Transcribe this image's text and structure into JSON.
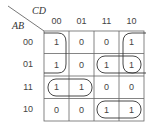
{
  "kmap": {
    "col_var": "CD",
    "row_var": "AB",
    "col_labels": [
      "00",
      "01",
      "11",
      "10"
    ],
    "row_labels": [
      "00",
      "01",
      "11",
      "10"
    ],
    "rows": [
      [
        "1",
        "0",
        "0",
        "1"
      ],
      [
        "1",
        "0",
        "1",
        "1"
      ],
      [
        "1",
        "1",
        "0",
        "0"
      ],
      [
        "0",
        "0",
        "1",
        "1"
      ]
    ]
  }
}
